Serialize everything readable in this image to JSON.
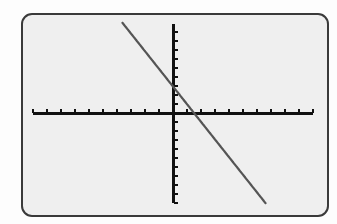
{
  "screen": {
    "background_color": "#efefef",
    "border_color": "#3a3a3a",
    "outer_background": "#fdfdfd"
  },
  "chart_data": {
    "type": "line",
    "title": "",
    "xlabel": "",
    "ylabel": "",
    "xlim": [
      -10,
      10
    ],
    "ylim": [
      -10,
      10
    ],
    "xscl": 1,
    "yscl": 1,
    "grid": false,
    "legend": null,
    "axes_color": "#111111",
    "series": [
      {
        "name": "Y1",
        "equation": "y = -2x + 3",
        "slope": -2,
        "intercept": 3,
        "color": "#555555",
        "x": [
          -3.6,
          6.6
        ],
        "y": [
          10,
          -10
        ]
      }
    ],
    "x_intercept": 1.5,
    "y_intercept": 3
  },
  "layout": {
    "origin_px": [
      173,
      113
    ],
    "x_unit_px": 14,
    "y_unit_px": 9,
    "x_axis_px": [
      33,
      313
    ],
    "y_axis_px": [
      24,
      203
    ]
  }
}
